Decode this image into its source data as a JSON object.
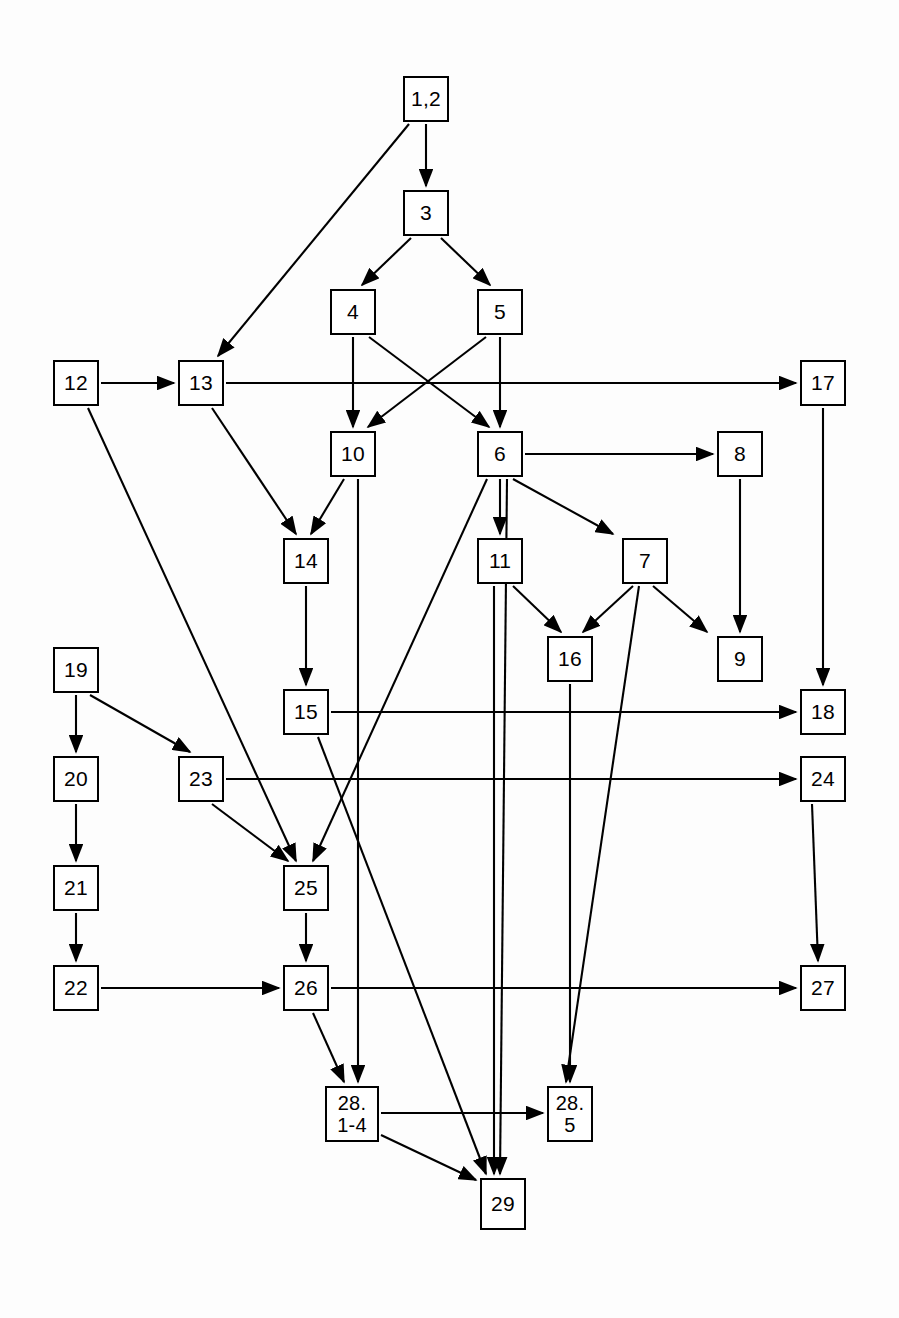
{
  "diagram": {
    "type": "directed-graph",
    "width": 899,
    "height": 1318,
    "node_size": 46,
    "stroke_color": "#000000",
    "node_fill": "#ffffff",
    "background": "#fdfdfd",
    "nodes": [
      {
        "id": "n1_2",
        "label": "1,2",
        "x": 403,
        "y": 76,
        "w": 46,
        "h": 46
      },
      {
        "id": "n3",
        "label": "3",
        "x": 403,
        "y": 190,
        "w": 46,
        "h": 46
      },
      {
        "id": "n4",
        "label": "4",
        "x": 330,
        "y": 289,
        "w": 46,
        "h": 46
      },
      {
        "id": "n5",
        "label": "5",
        "x": 477,
        "y": 289,
        "w": 46,
        "h": 46
      },
      {
        "id": "n12",
        "label": "12",
        "x": 53,
        "y": 360,
        "w": 46,
        "h": 46
      },
      {
        "id": "n13",
        "label": "13",
        "x": 178,
        "y": 360,
        "w": 46,
        "h": 46
      },
      {
        "id": "n17",
        "label": "17",
        "x": 800,
        "y": 360,
        "w": 46,
        "h": 46
      },
      {
        "id": "n10",
        "label": "10",
        "x": 330,
        "y": 431,
        "w": 46,
        "h": 46
      },
      {
        "id": "n6",
        "label": "6",
        "x": 477,
        "y": 431,
        "w": 46,
        "h": 46
      },
      {
        "id": "n8",
        "label": "8",
        "x": 717,
        "y": 431,
        "w": 46,
        "h": 46
      },
      {
        "id": "n14",
        "label": "14",
        "x": 283,
        "y": 538,
        "w": 46,
        "h": 46
      },
      {
        "id": "n11",
        "label": "11",
        "x": 477,
        "y": 538,
        "w": 46,
        "h": 46
      },
      {
        "id": "n7",
        "label": "7",
        "x": 622,
        "y": 538,
        "w": 46,
        "h": 46
      },
      {
        "id": "n16",
        "label": "16",
        "x": 547,
        "y": 636,
        "w": 46,
        "h": 46
      },
      {
        "id": "n9",
        "label": "9",
        "x": 717,
        "y": 636,
        "w": 46,
        "h": 46
      },
      {
        "id": "n19",
        "label": "19",
        "x": 53,
        "y": 647,
        "w": 46,
        "h": 46
      },
      {
        "id": "n15",
        "label": "15",
        "x": 283,
        "y": 689,
        "w": 46,
        "h": 46
      },
      {
        "id": "n18",
        "label": "18",
        "x": 800,
        "y": 689,
        "w": 46,
        "h": 46
      },
      {
        "id": "n20",
        "label": "20",
        "x": 53,
        "y": 756,
        "w": 46,
        "h": 46
      },
      {
        "id": "n23",
        "label": "23",
        "x": 178,
        "y": 756,
        "w": 46,
        "h": 46
      },
      {
        "id": "n24",
        "label": "24",
        "x": 800,
        "y": 756,
        "w": 46,
        "h": 46
      },
      {
        "id": "n21",
        "label": "21",
        "x": 53,
        "y": 865,
        "w": 46,
        "h": 46
      },
      {
        "id": "n25",
        "label": "25",
        "x": 283,
        "y": 865,
        "w": 46,
        "h": 46
      },
      {
        "id": "n22",
        "label": "22",
        "x": 53,
        "y": 965,
        "w": 46,
        "h": 46
      },
      {
        "id": "n26",
        "label": "26",
        "x": 283,
        "y": 965,
        "w": 46,
        "h": 46
      },
      {
        "id": "n27",
        "label": "27",
        "x": 800,
        "y": 965,
        "w": 46,
        "h": 46
      },
      {
        "id": "n28_14",
        "label": "28.\n1-4",
        "x": 325,
        "y": 1086,
        "w": 54,
        "h": 56
      },
      {
        "id": "n28_5",
        "label": "28.\n5",
        "x": 547,
        "y": 1086,
        "w": 46,
        "h": 56
      },
      {
        "id": "n29",
        "label": "29",
        "x": 480,
        "y": 1178,
        "w": 46,
        "h": 52
      }
    ],
    "edges": [
      {
        "from": "n1_2",
        "to": "n13",
        "x1": 409,
        "y1": 124,
        "x2": 218,
        "y2": 356
      },
      {
        "from": "n1_2",
        "to": "n3",
        "x1": 426,
        "y1": 124,
        "x2": 426,
        "y2": 186
      },
      {
        "from": "n3",
        "to": "n4",
        "x1": 411,
        "y1": 238,
        "x2": 362,
        "y2": 285
      },
      {
        "from": "n3",
        "to": "n5",
        "x1": 441,
        "y1": 238,
        "x2": 490,
        "y2": 285
      },
      {
        "from": "n4",
        "to": "n10",
        "x1": 353,
        "y1": 337,
        "x2": 353,
        "y2": 427
      },
      {
        "from": "n4",
        "to": "n6",
        "x1": 369,
        "y1": 337,
        "x2": 489,
        "y2": 427
      },
      {
        "from": "n5",
        "to": "n10",
        "x1": 486,
        "y1": 337,
        "x2": 368,
        "y2": 427
      },
      {
        "from": "n5",
        "to": "n6",
        "x1": 500,
        "y1": 337,
        "x2": 500,
        "y2": 427
      },
      {
        "from": "n12",
        "to": "n13",
        "x1": 101,
        "y1": 383,
        "x2": 174,
        "y2": 383
      },
      {
        "from": "n12",
        "to": "n25",
        "x1": 88,
        "y1": 408,
        "x2": 296,
        "y2": 861
      },
      {
        "from": "n13",
        "to": "n17",
        "x1": 226,
        "y1": 383,
        "x2": 796,
        "y2": 383
      },
      {
        "from": "n13",
        "to": "n14",
        "x1": 212,
        "y1": 408,
        "x2": 296,
        "y2": 534
      },
      {
        "from": "n10",
        "to": "n14",
        "x1": 344,
        "y1": 479,
        "x2": 311,
        "y2": 534
      },
      {
        "from": "n10",
        "to": "n28_14",
        "x1": 358,
        "y1": 479,
        "x2": 358,
        "y2": 1082
      },
      {
        "from": "n6",
        "to": "n8",
        "x1": 525,
        "y1": 454,
        "x2": 713,
        "y2": 454
      },
      {
        "from": "n6",
        "to": "n11",
        "x1": 500,
        "y1": 479,
        "x2": 500,
        "y2": 534
      },
      {
        "from": "n6",
        "to": "n7",
        "x1": 513,
        "y1": 479,
        "x2": 613,
        "y2": 534
      },
      {
        "from": "n6",
        "to": "n25",
        "x1": 487,
        "y1": 479,
        "x2": 313,
        "y2": 861
      },
      {
        "from": "n6",
        "to": "n29",
        "x1": 507,
        "y1": 479,
        "x2": 500,
        "y2": 1174
      },
      {
        "from": "n8",
        "to": "n9",
        "x1": 740,
        "y1": 479,
        "x2": 740,
        "y2": 632
      },
      {
        "from": "n17",
        "to": "n18",
        "x1": 823,
        "y1": 408,
        "x2": 823,
        "y2": 685
      },
      {
        "from": "n11",
        "to": "n16",
        "x1": 513,
        "y1": 586,
        "x2": 561,
        "y2": 632
      },
      {
        "from": "n11",
        "to": "n29",
        "x1": 494,
        "y1": 586,
        "x2": 494,
        "y2": 1174
      },
      {
        "from": "n7",
        "to": "n16",
        "x1": 633,
        "y1": 586,
        "x2": 583,
        "y2": 632
      },
      {
        "from": "n7",
        "to": "n9",
        "x1": 653,
        "y1": 586,
        "x2": 707,
        "y2": 632
      },
      {
        "from": "n7",
        "to": "n28_5",
        "x1": 639,
        "y1": 586,
        "x2": 566,
        "y2": 1082
      },
      {
        "from": "n16",
        "to": "n28_5",
        "x1": 570,
        "y1": 684,
        "x2": 570,
        "y2": 1082
      },
      {
        "from": "n14",
        "to": "n15",
        "x1": 306,
        "y1": 586,
        "x2": 306,
        "y2": 685
      },
      {
        "from": "n15",
        "to": "n18",
        "x1": 331,
        "y1": 712,
        "x2": 796,
        "y2": 712
      },
      {
        "from": "n15",
        "to": "n29",
        "x1": 318,
        "y1": 737,
        "x2": 486,
        "y2": 1174
      },
      {
        "from": "n19",
        "to": "n20",
        "x1": 76,
        "y1": 695,
        "x2": 76,
        "y2": 752
      },
      {
        "from": "n19",
        "to": "n23",
        "x1": 90,
        "y1": 695,
        "x2": 190,
        "y2": 752
      },
      {
        "from": "n20",
        "to": "n21",
        "x1": 76,
        "y1": 804,
        "x2": 76,
        "y2": 861
      },
      {
        "from": "n21",
        "to": "n22",
        "x1": 76,
        "y1": 913,
        "x2": 76,
        "y2": 961
      },
      {
        "from": "n23",
        "to": "n24",
        "x1": 226,
        "y1": 779,
        "x2": 796,
        "y2": 779
      },
      {
        "from": "n23",
        "to": "n25",
        "x1": 212,
        "y1": 804,
        "x2": 288,
        "y2": 861
      },
      {
        "from": "n24",
        "to": "n27",
        "x1": 812,
        "y1": 804,
        "x2": 818,
        "y2": 961
      },
      {
        "from": "n22",
        "to": "n26",
        "x1": 101,
        "y1": 988,
        "x2": 279,
        "y2": 988
      },
      {
        "from": "n25",
        "to": "n26",
        "x1": 306,
        "y1": 913,
        "x2": 306,
        "y2": 961
      },
      {
        "from": "n26",
        "to": "n27",
        "x1": 331,
        "y1": 988,
        "x2": 796,
        "y2": 988
      },
      {
        "from": "n26",
        "to": "n28_14",
        "x1": 313,
        "y1": 1013,
        "x2": 344,
        "y2": 1082
      },
      {
        "from": "n28_14",
        "to": "n28_5",
        "x1": 381,
        "y1": 1113,
        "x2": 543,
        "y2": 1113
      },
      {
        "from": "n28_14",
        "to": "n29",
        "x1": 381,
        "y1": 1135,
        "x2": 476,
        "y2": 1180
      }
    ]
  }
}
